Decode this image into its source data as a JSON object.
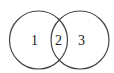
{
  "diagram": {
    "type": "venn",
    "circles": [
      {
        "name": "left",
        "cx": 38.5,
        "cy": 40,
        "r": 29,
        "stroke": "#444444"
      },
      {
        "name": "right",
        "cx": 80,
        "cy": 40,
        "r": 29,
        "stroke": "#444444"
      }
    ],
    "regions": [
      {
        "label": "1",
        "x": 24,
        "y": 45
      },
      {
        "label": "2",
        "x": 55,
        "y": 45
      },
      {
        "label": "3",
        "x": 77,
        "y": 45
      }
    ]
  }
}
